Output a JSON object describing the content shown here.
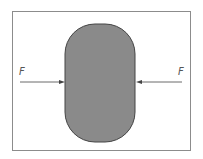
{
  "diagram": {
    "title": "",
    "frame_color": "#8c8c8c",
    "body": {
      "shape": "rounded-rectangle",
      "fill": "#8a8a8a",
      "stroke": "#444444"
    },
    "forces": [
      {
        "label": "F",
        "side": "left",
        "direction": "right"
      },
      {
        "label": "F",
        "side": "right",
        "direction": "left"
      }
    ],
    "arrow_color": "#444444"
  }
}
